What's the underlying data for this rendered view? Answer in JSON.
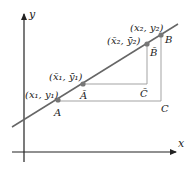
{
  "figure": {
    "type": "geometric diagram",
    "colors": {
      "axis": "#222222",
      "line": "#666666",
      "point": "#777777",
      "guide": "#999999"
    }
  },
  "axes": {
    "x_label": "x",
    "y_label": "y"
  },
  "points": {
    "A": {
      "label": "A",
      "coord_label": "(x₁, y₁)"
    },
    "A_bar": {
      "label": "Ā",
      "coord_label": "(x̄₁, ȳ₁)"
    },
    "B_bar": {
      "label": "B̄",
      "coord_label": "(x̄₂, ȳ₂)"
    },
    "B": {
      "label": "B",
      "coord_label": "(x₂, y₂)"
    },
    "C": {
      "label": "C"
    },
    "C_bar": {
      "label": "C̄"
    }
  }
}
